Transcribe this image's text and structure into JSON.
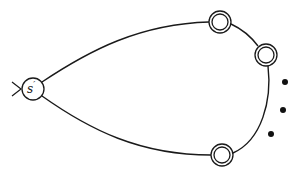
{
  "diagram": {
    "type": "automaton",
    "start_state": {
      "label": "s",
      "prime": "′",
      "cx": 33,
      "cy": 89,
      "r": 11
    },
    "start_arrow": "initial-marker",
    "accepting_states": [
      {
        "id": "accept-top",
        "cx": 220,
        "cy": 22,
        "r_outer": 11,
        "r_inner": 8
      },
      {
        "id": "accept-right",
        "cx": 266,
        "cy": 55,
        "r_outer": 11,
        "r_inner": 8
      },
      {
        "id": "accept-bottom",
        "cx": 222,
        "cy": 155,
        "r_outer": 11,
        "r_inner": 8
      }
    ],
    "ellipsis_dots": [
      {
        "cx": 285,
        "cy": 82
      },
      {
        "cx": 283,
        "cy": 110
      },
      {
        "cx": 271,
        "cy": 134
      }
    ],
    "colors": {
      "stroke": "#1a1a1a",
      "fill": "#ffffff",
      "dot": "#111111"
    }
  }
}
